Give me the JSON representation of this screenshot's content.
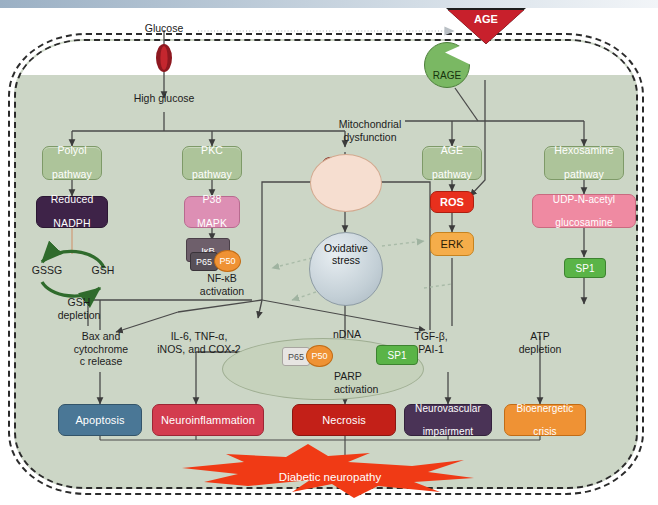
{
  "diagram": {
    "entry": {
      "glucose": "Glucose",
      "high_glucose": "High glucose"
    },
    "receptor": {
      "age": "AGE",
      "rage": "RAGE"
    },
    "pathways": [
      {
        "id": "polyol",
        "label": "Polyol\npathway",
        "color": "#adc49a"
      },
      {
        "id": "pkc",
        "label": "PKC\npathway",
        "color": "#adc49a"
      },
      {
        "id": "age",
        "label": "AGE\npathway",
        "color": "#adc49a"
      },
      {
        "id": "hexosamine",
        "label": "Hexosamine\npathway",
        "color": "#adc49a"
      }
    ],
    "pathway_labels": {
      "polyol_l1": "Polyol",
      "polyol_l2": "pathway",
      "pkc_l1": "PKC",
      "pkc_l2": "pathway",
      "age_l1": "AGE",
      "age_l2": "pathway",
      "hex_l1": "Hexosamine",
      "hex_l2": "pathway"
    },
    "mitochondrial": {
      "l1": "Mitochondrial",
      "l2": "dysfunction"
    },
    "oxidative": {
      "l1": "Oxidative",
      "l2": "stress"
    },
    "nodes": {
      "reduced_nadph_l1": "Reduced",
      "reduced_nadph_l2": "NADPH",
      "p38_l1": "P38",
      "p38_l2": "MAPK",
      "ros": "ROS",
      "erk": "ERK",
      "udp_l1": "UDP-N-acetyl",
      "udp_l2": "glucosamine",
      "sp1": "SP1",
      "ikb": "IκB",
      "p65": "P65",
      "p50": "P50"
    },
    "glutathione": {
      "gssg": "GSSG",
      "gsh": "GSH",
      "dep_l1": "GSH",
      "dep_l2": "depletion"
    },
    "nfkb": {
      "l1": "NF-κB",
      "l2": "activation"
    },
    "mediators": {
      "l1": "IL-6, TNF-α,",
      "l2": "iNOS, and COX-2"
    },
    "bax": {
      "l1": "Bax and",
      "l2": "cytochrome",
      "l3": "c release"
    },
    "ndna": {
      "l1": "nDNA",
      "l2": "damage"
    },
    "tgf": {
      "l1": "TGF-β,",
      "l2": "PAI-1"
    },
    "atp": {
      "l1": "ATP",
      "l2": "depletion"
    },
    "parp": {
      "l1": "PARP",
      "l2": "activation"
    },
    "nucleus_sp1": "SP1",
    "nucleus_p65": "P65",
    "nucleus_p50": "P50",
    "outcomes": [
      {
        "id": "apoptosis",
        "label": "Apoptosis",
        "color": "#4a7796"
      },
      {
        "id": "neuroinflammation",
        "label": "Neuroinflammation",
        "color": "#d33c4e"
      },
      {
        "id": "necrosis",
        "label": "Necrosis",
        "color": "#c32018"
      },
      {
        "id": "neurovascular",
        "label": "Neurovascular impairment",
        "color": "#4a3356"
      },
      {
        "id": "bioenergetic",
        "label": "Bioenergetic crisis",
        "color": "#ef9234"
      }
    ],
    "outcome_labels": {
      "apoptosis": "Apoptosis",
      "neuroinflammation": "Neuroinflammation",
      "necrosis": "Necrosis",
      "neurovascular_l1": "Neurovascular",
      "neurovascular_l2": "impairment",
      "bioenergetic_l1": "Bioenergetic",
      "bioenergetic_l2": "crisis"
    },
    "final": "Diabetic neuropathy"
  }
}
